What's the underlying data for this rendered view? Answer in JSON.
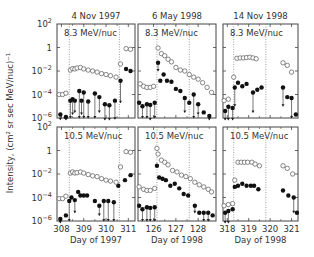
{
  "chart_data": {
    "type": "scatter",
    "ylabel": "Intensity, (cm^2 sr sec MeV/nuc)^-1",
    "yscale": "log",
    "ylim": [
      1e-06,
      100
    ],
    "ytick_labels": [
      "10^2",
      "1",
      "10^-2",
      "10^-4",
      "10^-6"
    ],
    "columns": [
      {
        "title": "4 Nov 1997",
        "xlabel": "Day of 1997",
        "xlim": [
          307.8,
          311.3
        ],
        "xticks": [
          308,
          309,
          310,
          311
        ],
        "dotted_lines": [
          308.35,
          310.6
        ]
      },
      {
        "title": "6 May 1998",
        "xlabel": "Day of 1998",
        "xlim": [
          125.3,
          128.8
        ],
        "xticks": [
          126,
          127,
          128
        ],
        "dotted_lines": [
          126.15,
          127.6
        ]
      },
      {
        "title": "14 Nov 1998",
        "xlabel": "Day of 1998",
        "xlim": [
          317.8,
          321.3
        ],
        "xticks": [
          318,
          319,
          320,
          321
        ],
        "dotted_lines": [
          318.3,
          319.8
        ]
      }
    ],
    "rows": [
      {
        "energy_label": "8.3 MeV/nuc"
      },
      {
        "energy_label": "10.5 MeV/nuc"
      }
    ],
    "series_legend": [
      "open circles: reference species",
      "filled circles with down-arrows: measured species (upper limits)"
    ],
    "panels": [
      {
        "row": 0,
        "col": 0,
        "open": [
          [
            307.9,
            0.0001
          ],
          [
            308.05,
            0.0001
          ],
          [
            308.2,
            0.00013
          ],
          [
            308.4,
            0.012
          ],
          [
            308.5,
            0.016
          ],
          [
            308.6,
            0.015
          ],
          [
            308.7,
            0.018
          ],
          [
            308.85,
            0.02
          ],
          [
            309.0,
            0.015
          ],
          [
            309.2,
            0.012
          ],
          [
            309.4,
            0.01
          ],
          [
            309.6,
            0.008
          ],
          [
            309.8,
            0.006
          ],
          [
            310.0,
            0.005
          ],
          [
            310.2,
            0.004
          ],
          [
            310.45,
            0.003
          ],
          [
            310.65,
            0.04
          ],
          [
            310.9,
            0.8
          ],
          [
            311.1,
            0.7
          ]
        ],
        "filled": [
          [
            307.95,
            2e-06,
            7e-07
          ],
          [
            308.2,
            1.2e-06,
            1e-07
          ],
          [
            308.4,
            3e-05,
            1e-06
          ],
          [
            308.5,
            4e-05,
            2e-06
          ],
          [
            308.6,
            3e-05,
            3e-06
          ],
          [
            308.8,
            0.0002,
            1e-06
          ],
          [
            309.0,
            0.00015,
            1e-06
          ],
          [
            308.9,
            3e-05,
            2e-06
          ],
          [
            309.2,
            2.5e-05,
            1e-06
          ],
          [
            309.5,
            0.00012,
            1e-06
          ],
          [
            309.7,
            6e-05,
            3e-06
          ],
          [
            309.95,
            1.5e-05,
            2e-07
          ],
          [
            310.15,
            1.2e-05,
            1e-07
          ],
          [
            310.4,
            3e-05,
            8e-07
          ],
          [
            310.65,
            0.0015,
            2e-05
          ],
          [
            310.9,
            0.015,
            null
          ],
          [
            311.1,
            0.01,
            null
          ]
        ]
      },
      {
        "row": 0,
        "col": 1,
        "open": [
          [
            125.4,
            0.0008
          ],
          [
            125.55,
            0.0005
          ],
          [
            125.7,
            0.0004
          ],
          [
            125.85,
            0.0004
          ],
          [
            126.0,
            0.0005
          ],
          [
            126.2,
            0.9
          ],
          [
            126.35,
            0.3
          ],
          [
            126.5,
            0.2
          ],
          [
            126.65,
            0.1
          ],
          [
            126.8,
            0.06
          ],
          [
            127.0,
            0.02
          ],
          [
            127.2,
            0.012
          ],
          [
            127.4,
            0.01
          ],
          [
            127.6,
            0.005
          ],
          [
            127.8,
            0.003
          ],
          [
            128.0,
            0.002
          ],
          [
            128.2,
            0.001
          ],
          [
            128.4,
            0.0004
          ],
          [
            128.6,
            0.00015
          ]
        ],
        "filled": [
          [
            125.35,
            2e-05,
            null
          ],
          [
            125.5,
            1e-05,
            1e-06
          ],
          [
            125.7,
            1.5e-05,
            1e-06
          ],
          [
            125.85,
            1.3e-05,
            5e-07
          ],
          [
            126.05,
            2e-05,
            1e-06
          ],
          [
            126.2,
            0.05,
            0.01
          ],
          [
            126.3,
            0.0015,
            null
          ],
          [
            126.45,
            0.005,
            null
          ],
          [
            126.6,
            0.0015,
            null
          ],
          [
            126.8,
            0.0012,
            null
          ],
          [
            127.0,
            0.0003,
            null
          ],
          [
            127.2,
            0.0002,
            null
          ],
          [
            127.4,
            5e-05,
            3e-06
          ],
          [
            127.6,
            2e-05,
            null
          ],
          [
            127.8,
            0.0001,
            1e-06
          ],
          [
            128.0,
            1.5e-05,
            2e-06
          ],
          [
            128.25,
            3e-06,
            null
          ],
          [
            128.5,
            1.5e-06,
            2e-07
          ]
        ]
      },
      {
        "row": 0,
        "col": 2,
        "open": [
          [
            317.85,
            3e-05
          ],
          [
            318.05,
            4e-05
          ],
          [
            318.3,
            0.003
          ],
          [
            318.45,
            0.12
          ],
          [
            318.6,
            0.13
          ],
          [
            318.75,
            0.13
          ],
          [
            318.9,
            0.14
          ],
          [
            319.05,
            0.15
          ],
          [
            319.2,
            0.13
          ],
          [
            319.35,
            0.11
          ],
          [
            320.6,
            0.05
          ],
          [
            320.8,
            0.03
          ],
          [
            321.0,
            0.008
          ]
        ],
        "filled": [
          [
            317.9,
            4e-06,
            1e-07
          ],
          [
            318.05,
            9e-06,
            5e-07
          ],
          [
            318.25,
            7e-06,
            2e-07
          ],
          [
            318.35,
            0.0004,
            1e-05
          ],
          [
            318.5,
            0.001,
            null
          ],
          [
            318.7,
            0.0005,
            null
          ],
          [
            318.9,
            0.0008,
            null
          ],
          [
            319.2,
            0.00015,
            3e-06
          ],
          [
            319.4,
            0.00025,
            null
          ],
          [
            319.6,
            0.0004,
            null
          ],
          [
            320.6,
            0.0004,
            1e-05
          ],
          [
            320.8,
            6e-05,
            null
          ],
          [
            321.0,
            5e-05,
            1e-06
          ],
          [
            321.2,
            2e-06,
            null
          ]
        ]
      },
      {
        "row": 1,
        "col": 0,
        "open": [
          [
            307.9,
            8e-05
          ],
          [
            308.05,
            8e-05
          ],
          [
            308.2,
            0.00013
          ],
          [
            308.4,
            0.012
          ],
          [
            308.5,
            0.015
          ],
          [
            308.6,
            0.012
          ],
          [
            308.7,
            0.013
          ],
          [
            308.85,
            0.015
          ],
          [
            309.0,
            0.012
          ],
          [
            309.2,
            0.009
          ],
          [
            309.4,
            0.007
          ],
          [
            309.6,
            0.006
          ],
          [
            309.8,
            0.004
          ],
          [
            310.0,
            0.003
          ],
          [
            310.2,
            0.0025
          ],
          [
            310.45,
            0.002
          ],
          [
            310.65,
            0.04
          ],
          [
            310.9,
            0.8
          ],
          [
            311.1,
            0.7
          ]
        ],
        "filled": [
          [
            307.95,
            1.5e-06,
            5e-07
          ],
          [
            308.2,
            3e-06,
            null
          ],
          [
            308.35,
            5e-05,
            1e-06
          ],
          [
            308.45,
            0.0001,
            null
          ],
          [
            308.6,
            6e-05,
            5e-06
          ],
          [
            308.75,
            0.0003,
            null
          ],
          [
            308.85,
            0.00015,
            null
          ],
          [
            309.0,
            0.00015,
            null
          ],
          [
            309.15,
            0.00015,
            null
          ],
          [
            309.5,
            5e-05,
            null
          ],
          [
            309.7,
            2e-05,
            3e-06
          ],
          [
            309.9,
            5e-05,
            1e-06
          ],
          [
            310.1,
            5e-05,
            1e-06
          ],
          [
            310.35,
            4e-05,
            1e-06
          ],
          [
            310.55,
            0.001,
            null
          ],
          [
            310.85,
            0.003,
            null
          ],
          [
            311.1,
            0.008,
            null
          ]
        ]
      },
      {
        "row": 1,
        "col": 1,
        "open": [
          [
            125.35,
            0.0008
          ],
          [
            125.55,
            0.0005
          ],
          [
            125.7,
            0.0004
          ],
          [
            125.85,
            0.0004
          ],
          [
            126.05,
            0.0006
          ],
          [
            126.15,
            1.5
          ],
          [
            126.2,
            0.5
          ],
          [
            126.35,
            0.15
          ],
          [
            126.5,
            0.1
          ],
          [
            126.65,
            0.06
          ],
          [
            126.85,
            0.02
          ],
          [
            127.05,
            0.015
          ],
          [
            127.25,
            0.008
          ],
          [
            127.45,
            0.006
          ],
          [
            127.65,
            0.004
          ],
          [
            127.85,
            0.002
          ],
          [
            128.05,
            0.0012
          ],
          [
            128.25,
            0.0008
          ],
          [
            128.45,
            0.0005
          ],
          [
            128.6,
            0.0003
          ]
        ],
        "filled": [
          [
            125.35,
            2e-05,
            null
          ],
          [
            125.5,
            1e-05,
            1e-06
          ],
          [
            125.7,
            1.5e-05,
            1e-06
          ],
          [
            125.85,
            1.3e-05,
            1e-06
          ],
          [
            126.05,
            1.5e-05,
            1e-06
          ],
          [
            126.15,
            0.05,
            null
          ],
          [
            126.25,
            0.005,
            null
          ],
          [
            126.4,
            0.004,
            null
          ],
          [
            126.55,
            0.003,
            null
          ],
          [
            126.75,
            0.001,
            null
          ],
          [
            126.95,
            0.0015,
            null
          ],
          [
            127.15,
            0.0006,
            null
          ],
          [
            127.35,
            0.0002,
            null
          ],
          [
            127.55,
            0.00015,
            null
          ],
          [
            127.85,
            2e-05,
            5e-06
          ],
          [
            128.05,
            5e-06,
            null
          ],
          [
            128.25,
            5e-06,
            1e-06
          ],
          [
            128.45,
            5e-06,
            1e-06
          ],
          [
            128.65,
            3e-06,
            null
          ]
        ]
      },
      {
        "row": 1,
        "col": 2,
        "open": [
          [
            317.85,
            2e-05
          ],
          [
            318.05,
            2.5e-05
          ],
          [
            318.25,
            3e-05
          ],
          [
            318.35,
            0.003
          ],
          [
            318.5,
            0.1
          ],
          [
            318.65,
            0.1
          ],
          [
            318.8,
            0.1
          ],
          [
            318.95,
            0.1
          ],
          [
            319.15,
            0.1
          ],
          [
            319.3,
            0.07
          ],
          [
            319.5,
            0.05
          ],
          [
            320.6,
            0.05
          ],
          [
            320.8,
            0.03
          ],
          [
            321.05,
            0.01
          ]
        ],
        "filled": [
          [
            317.9,
            5e-06,
            1e-07
          ],
          [
            318.05,
            7e-06,
            5e-07
          ],
          [
            318.25,
            1e-05,
            null
          ],
          [
            318.35,
            0.0008,
            null
          ],
          [
            318.5,
            0.001,
            null
          ],
          [
            318.7,
            0.0015,
            null
          ],
          [
            318.9,
            0.001,
            null
          ],
          [
            319.1,
            0.001,
            null
          ],
          [
            319.25,
            0.001,
            null
          ],
          [
            319.45,
            0.0005,
            null
          ],
          [
            320.6,
            0.0004,
            null
          ],
          [
            320.85,
            0.00015,
            null
          ],
          [
            321.1,
            0.0001,
            5e-06
          ],
          [
            321.25,
            5e-06,
            null
          ]
        ]
      }
    ]
  }
}
